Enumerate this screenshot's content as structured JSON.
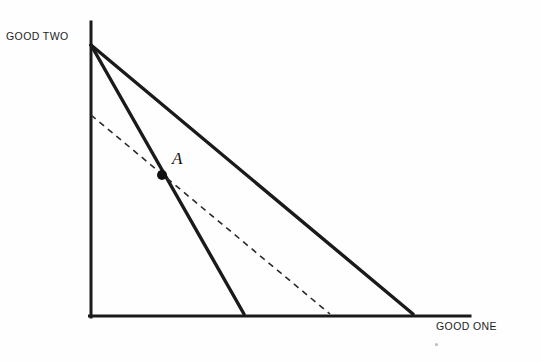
{
  "figure": {
    "background_color": "#fefefe",
    "ink_color": "#1a1a1a",
    "width": 541,
    "height": 362
  },
  "labels": {
    "y_axis": "GOOD TWO",
    "x_axis": "GOOD ONE",
    "point_a": "A"
  },
  "chart_data": {
    "type": "line",
    "title": "",
    "xlabel": "GOOD ONE",
    "ylabel": "GOOD TWO",
    "grid": false,
    "legend": null,
    "axes": {
      "origin_px": [
        91,
        317
      ],
      "y_axis_top_px": [
        91,
        22
      ],
      "x_axis_right_px": [
        470,
        317
      ],
      "line_width_px": 3,
      "color": "#1a1a1a"
    },
    "series": [
      {
        "name": "flat-budget-line",
        "style": "solid",
        "width_px": 3.4,
        "color": "#1a1a1a",
        "points_px": [
          [
            91,
            45
          ],
          [
            413,
            314
          ]
        ],
        "description": "Original budget line from vertical intercept on GOOD TWO axis to horizontal intercept far right on GOOD ONE axis"
      },
      {
        "name": "steep-budget-line",
        "style": "solid",
        "width_px": 3.4,
        "color": "#1a1a1a",
        "points_px": [
          [
            91,
            45
          ],
          [
            244,
            314
          ]
        ],
        "description": "Steeper budget line sharing the same GOOD TWO intercept, with a nearer GOOD ONE intercept"
      },
      {
        "name": "dashed-indifference-line",
        "style": "dashed",
        "width_px": 1.6,
        "dash_pattern_px": [
          6,
          5
        ],
        "color": "#2a2a2a",
        "points_px": [
          [
            91,
            115
          ],
          [
            330,
            314
          ]
        ],
        "description": "Dashed line through point A, lower vertical intercept, intermediate horizontal intercept"
      }
    ],
    "annotations": [
      {
        "name": "point-a",
        "label": "A",
        "marker": "filled-circle",
        "marker_radius_px": 5,
        "position_px": [
          162,
          175
        ],
        "label_position_px": [
          178,
          160
        ],
        "description": "Intersection of the steep solid budget line and the dashed line"
      }
    ]
  }
}
